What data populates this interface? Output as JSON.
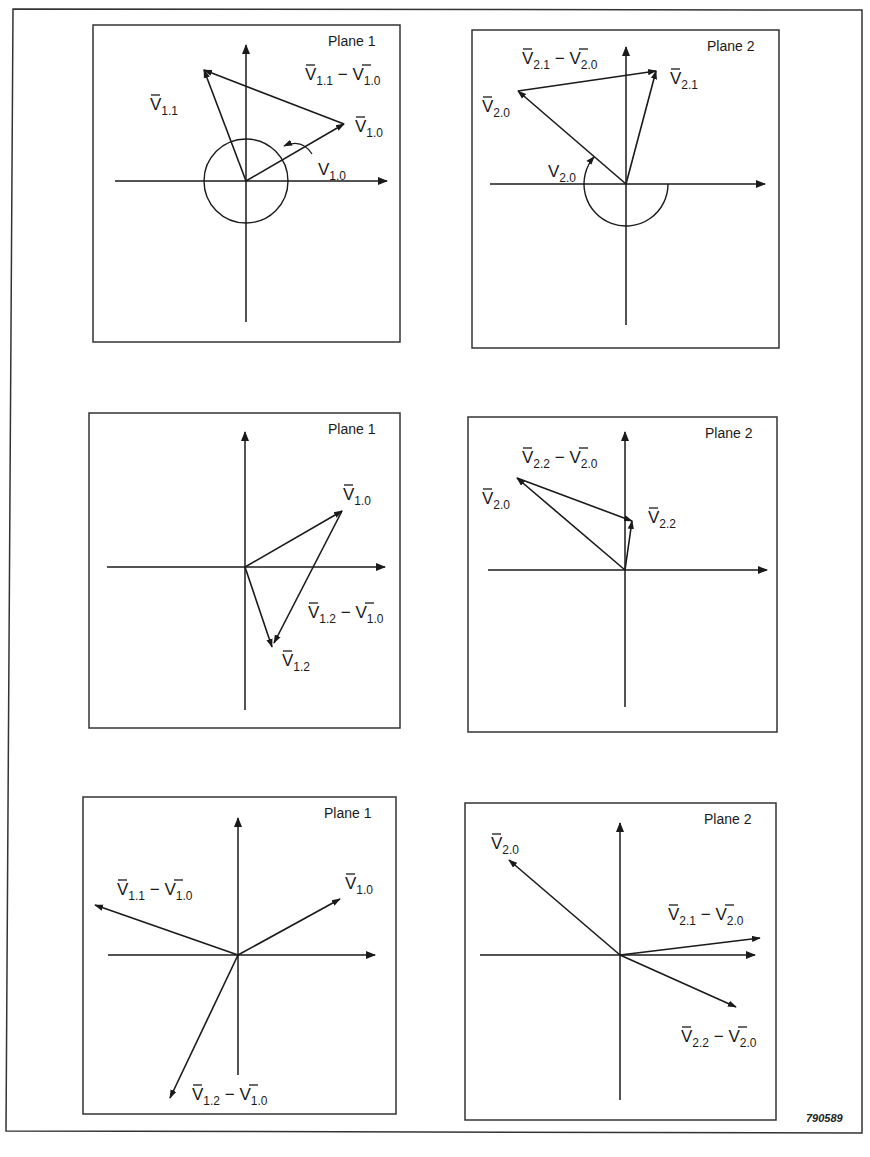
{
  "figure_id": "790589",
  "colors": {
    "ink": "#1a1a1a",
    "background": "#ffffff"
  },
  "panels": [
    {
      "id": "row1-plane1",
      "title": "Plane 1",
      "box": [
        93,
        25,
        307,
        317
      ],
      "origin": [
        246,
        181
      ],
      "axes": {
        "x": [
          115,
          387
        ],
        "y_top": 45,
        "y_bottom": 322
      },
      "circle": {
        "r": 42,
        "type": "full"
      },
      "arrows": [
        {
          "name": "V1.0",
          "from": [
            246,
            181
          ],
          "to": [
            344,
            124
          ]
        },
        {
          "name": "V1.1",
          "from": [
            246,
            181
          ],
          "to": [
            204,
            70
          ]
        },
        {
          "name": "V1.1-V1.0",
          "from": [
            344,
            124
          ],
          "to": [
            204,
            70
          ]
        }
      ],
      "angle_arrow": {
        "path": "M 313 155 Q 303 140 285 147",
        "arrow_at": [
          278,
          157
        ]
      },
      "labels": [
        {
          "text": "V",
          "bar": true,
          "sub": "1.1",
          "x": 150,
          "y": 110
        },
        {
          "text": "V",
          "bar": true,
          "sub": "1.1",
          "sub2": "1.0",
          "diff": true,
          "x": 305,
          "y": 80
        },
        {
          "text": "V",
          "bar": true,
          "sub": "1.0",
          "x": 355,
          "y": 132
        },
        {
          "text": "V",
          "bar": false,
          "sub": "1.0",
          "x": 318,
          "y": 175
        }
      ]
    },
    {
      "id": "row1-plane2",
      "title": "Plane 2",
      "box": [
        472,
        30,
        307,
        318
      ],
      "origin": [
        626,
        184
      ],
      "axes": {
        "x": [
          490,
          765
        ],
        "y_top": 47,
        "y_bottom": 325
      },
      "circle": {
        "r": 42,
        "type": "lower-half-plus"
      },
      "arrows": [
        {
          "name": "V2.0",
          "from": [
            626,
            184
          ],
          "to": [
            518,
            91
          ]
        },
        {
          "name": "V2.1",
          "from": [
            626,
            184
          ],
          "to": [
            656,
            71
          ]
        },
        {
          "name": "V2.1-V2.0",
          "from": [
            518,
            91
          ],
          "to": [
            656,
            71
          ]
        }
      ],
      "labels": [
        {
          "text": "V",
          "bar": true,
          "sub": "2.1",
          "sub2": "2.0",
          "diff": true,
          "x": 522,
          "y": 64
        },
        {
          "text": "V",
          "bar": true,
          "sub": "2.1",
          "x": 670,
          "y": 84
        },
        {
          "text": "V",
          "bar": true,
          "sub": "2.0",
          "x": 482,
          "y": 112
        },
        {
          "text": "V",
          "bar": false,
          "sub": "2.0",
          "x": 548,
          "y": 177
        }
      ]
    },
    {
      "id": "row2-plane1",
      "title": "Plane 1",
      "box": [
        89,
        413,
        311,
        315
      ],
      "origin": [
        245,
        567
      ],
      "axes": {
        "x": [
          107,
          385
        ],
        "y_top": 432,
        "y_bottom": 710
      },
      "arrows": [
        {
          "name": "V1.0",
          "from": [
            245,
            567
          ],
          "to": [
            342,
            511
          ]
        },
        {
          "name": "V1.2",
          "from": [
            245,
            567
          ],
          "to": [
            272,
            647
          ]
        },
        {
          "name": "V1.2-V1.0",
          "from": [
            342,
            511
          ],
          "to": [
            274,
            643
          ]
        }
      ],
      "labels": [
        {
          "text": "V",
          "bar": true,
          "sub": "1.0",
          "x": 343,
          "y": 500
        },
        {
          "text": "V",
          "bar": true,
          "sub": "1.2",
          "sub2": "1.0",
          "diff": true,
          "x": 308,
          "y": 618
        },
        {
          "text": "V",
          "bar": true,
          "sub": "1.2",
          "x": 282,
          "y": 666
        }
      ]
    },
    {
      "id": "row2-plane2",
      "title": "Plane 2",
      "box": [
        468,
        417,
        309,
        315
      ],
      "origin": [
        625,
        570
      ],
      "axes": {
        "x": [
          488,
          767
        ],
        "y_top": 432,
        "y_bottom": 707
      },
      "arrows": [
        {
          "name": "V2.0",
          "from": [
            625,
            570
          ],
          "to": [
            517,
            478
          ]
        },
        {
          "name": "V2.2",
          "from": [
            625,
            570
          ],
          "to": [
            632,
            521
          ]
        },
        {
          "name": "V2.2-V2.0",
          "from": [
            517,
            478
          ],
          "to": [
            632,
            521
          ]
        }
      ],
      "labels": [
        {
          "text": "V",
          "bar": true,
          "sub": "2.2",
          "sub2": "2.0",
          "diff": true,
          "x": 522,
          "y": 463
        },
        {
          "text": "V",
          "bar": true,
          "sub": "2.0",
          "x": 482,
          "y": 504
        },
        {
          "text": "V",
          "bar": true,
          "sub": "2.2",
          "x": 648,
          "y": 523
        }
      ]
    },
    {
      "id": "row3-plane1",
      "title": "Plane 1",
      "box": [
        83,
        797,
        313,
        317
      ],
      "origin": [
        238,
        955
      ],
      "axes": {
        "x": [
          108,
          375
        ],
        "y_top": 818,
        "y_bottom": 1075
      },
      "arrows": [
        {
          "name": "V1.0",
          "from": [
            238,
            955
          ],
          "to": [
            340,
            899
          ]
        },
        {
          "name": "V1.1-V1.0",
          "from": [
            238,
            955
          ],
          "to": [
            95,
            905
          ]
        },
        {
          "name": "V1.2-V1.0",
          "from": [
            238,
            955
          ],
          "to": [
            170,
            1098
          ]
        }
      ],
      "labels": [
        {
          "text": "V",
          "bar": true,
          "sub": "1.1",
          "sub2": "1.0",
          "diff": true,
          "x": 117,
          "y": 895
        },
        {
          "text": "V",
          "bar": true,
          "sub": "1.0",
          "x": 345,
          "y": 889
        },
        {
          "text": "V",
          "bar": true,
          "sub": "1.2",
          "sub2": "1.0",
          "diff": true,
          "x": 192,
          "y": 1100
        }
      ]
    },
    {
      "id": "row3-plane2",
      "title": "Plane 2",
      "box": [
        465,
        803,
        311,
        317
      ],
      "origin": [
        620,
        955
      ],
      "axes": {
        "x": [
          480,
          755
        ],
        "y_top": 823,
        "y_bottom": 1100
      },
      "arrows": [
        {
          "name": "V2.0",
          "from": [
            620,
            955
          ],
          "to": [
            509,
            860
          ]
        },
        {
          "name": "V2.1-V2.0",
          "from": [
            620,
            955
          ],
          "to": [
            760,
            938
          ]
        },
        {
          "name": "V2.2-V2.0",
          "from": [
            620,
            955
          ],
          "to": [
            736,
            1007
          ]
        }
      ],
      "labels": [
        {
          "text": "V",
          "bar": true,
          "sub": "2.0",
          "x": 491,
          "y": 849
        },
        {
          "text": "V",
          "bar": true,
          "sub": "2.1",
          "sub2": "2.0",
          "diff": true,
          "x": 668,
          "y": 920
        },
        {
          "text": "V",
          "bar": true,
          "sub": "2.2",
          "sub2": "2.0",
          "diff": true,
          "x": 681,
          "y": 1042
        }
      ]
    }
  ]
}
